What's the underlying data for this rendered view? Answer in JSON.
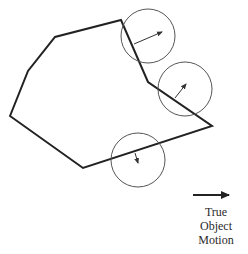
{
  "diagram": {
    "type": "aperture-problem",
    "polygon": {
      "points": [
        [
          10,
          116
        ],
        [
          28,
          71
        ],
        [
          55,
          37
        ],
        [
          121,
          20
        ],
        [
          148,
          82
        ],
        [
          212,
          126
        ],
        [
          83,
          168
        ]
      ],
      "stroke": "#222222",
      "stroke_width": 2
    },
    "apertures": [
      {
        "id": "aperture-top",
        "cx": 148,
        "cy": 36,
        "r": 27,
        "arrow": {
          "x1": 134,
          "y1": 44,
          "x2": 162,
          "y2": 32
        }
      },
      {
        "id": "aperture-right",
        "cx": 185,
        "cy": 89,
        "r": 27,
        "arrow": {
          "x1": 175,
          "y1": 98,
          "x2": 186,
          "y2": 84
        }
      },
      {
        "id": "aperture-bottom",
        "cx": 138,
        "cy": 160,
        "r": 27,
        "arrow": {
          "x1": 135,
          "y1": 153,
          "x2": 138,
          "y2": 163
        }
      }
    ],
    "circle_stroke": "#555555",
    "legend": {
      "arrow": {
        "x1": 193,
        "y1": 195,
        "x2": 229,
        "y2": 195
      },
      "label_lines": [
        "True",
        "Object",
        "Motion"
      ]
    }
  }
}
